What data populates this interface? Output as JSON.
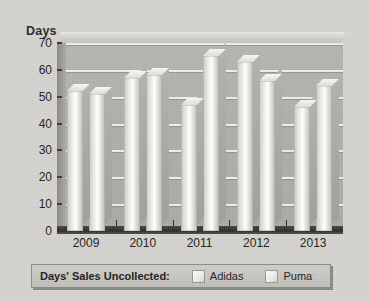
{
  "chart_data": {
    "type": "bar",
    "title": "",
    "subtitle": "",
    "xlabel": "",
    "ylabel": "Days",
    "categories": [
      "2009",
      "2010",
      "2011",
      "2012",
      "2013"
    ],
    "series": [
      {
        "name": "Adidas",
        "values": [
          52,
          57,
          47,
          63,
          46
        ],
        "color": "#eceae6"
      },
      {
        "name": "Puma",
        "values": [
          51,
          58,
          65,
          56,
          54
        ],
        "color": "#eceae6"
      }
    ],
    "ylim": [
      0,
      70
    ],
    "yticks": [
      0,
      10,
      20,
      30,
      40,
      50,
      60,
      70
    ],
    "ytick_labels": [
      "0",
      "10",
      "20",
      "30",
      "40",
      "50",
      "60",
      "70"
    ],
    "grid": true,
    "grid_axis": "y",
    "legend_position": "bottom",
    "legend_title": "Days' Sales Uncollected:",
    "style": "3d-grayscale"
  },
  "legend": {
    "title": "Days' Sales Uncollected:",
    "entries": [
      {
        "label": "Adidas",
        "swatch": "legend-swatch-adidas"
      },
      {
        "label": "Puma",
        "swatch": "legend-swatch-puma"
      }
    ]
  },
  "colors": {
    "background": "#d7d6d2",
    "wall": "#b5b3ae",
    "gridline": "#f2f1ee",
    "floor": "#2e2e2e",
    "bar_face": "#ffffff",
    "text": "#232323"
  }
}
